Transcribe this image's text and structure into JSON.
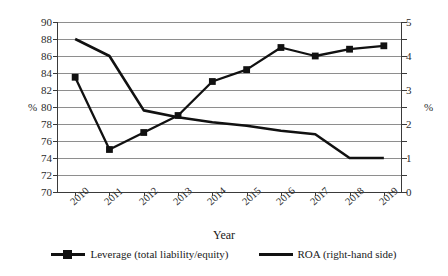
{
  "chart_data": {
    "type": "line",
    "title": "",
    "xlabel": "Year",
    "ylabel": "%",
    "ylabel_right": "%",
    "categories": [
      "2010",
      "2011",
      "2012",
      "2013",
      "2014",
      "2015",
      "2016",
      "2017",
      "2018",
      "2019"
    ],
    "ylim": [
      70,
      90
    ],
    "ylim_right": [
      0,
      5
    ],
    "yticks": [
      90,
      88,
      86,
      84,
      82,
      80,
      78,
      76,
      74,
      72,
      70
    ],
    "yticks_right": [
      5,
      4,
      3,
      2,
      1,
      0
    ],
    "grid": true,
    "legend_position": "bottom",
    "series": [
      {
        "name": "Leverage (total liability/equity)",
        "axis": "left",
        "marker": "square",
        "values": [
          83.5,
          75.0,
          77.0,
          79.0,
          83.0,
          84.4,
          87.0,
          86.0,
          86.8,
          87.2
        ]
      },
      {
        "name": "ROA (right-hand side)",
        "axis": "right",
        "marker": "none",
        "values": [
          4.5,
          4.0,
          2.4,
          2.2,
          2.05,
          1.95,
          1.8,
          1.7,
          1.0,
          1.0
        ]
      }
    ]
  },
  "legend": {
    "items": [
      {
        "label": "Leverage (total liability/equity)"
      },
      {
        "label": "ROA (right-hand side)"
      }
    ]
  }
}
